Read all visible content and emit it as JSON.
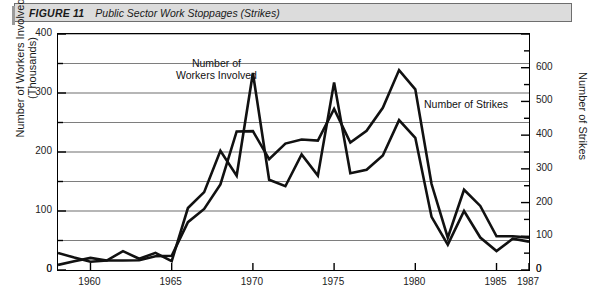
{
  "figure": {
    "number_label": "FIGURE 11",
    "title": "Public Sector Work Stoppages (Strikes)"
  },
  "axes": {
    "left_title": "Number of Workers Involved (Thousands)",
    "right_title": "Number of Strikes",
    "left_ticks": [
      "0",
      "100",
      "200",
      "300",
      "400"
    ],
    "right_ticks": [
      "0",
      "100",
      "200",
      "300",
      "400",
      "500",
      "600"
    ],
    "x_ticks": [
      "1960",
      "1965",
      "1970",
      "1975",
      "1980",
      "1985",
      "1987"
    ]
  },
  "annotations": {
    "workers_line1": "Number of",
    "workers_line2": "Workers Involved",
    "strikes": "Number of Strikes"
  },
  "colors": {
    "series_line": "#111111",
    "grid": "#6f6f6f",
    "frame": "#000000",
    "title_bar_bg": "#dcdcdc"
  },
  "chart_data": {
    "type": "line",
    "title": "Public Sector Work Stoppages (Strikes)",
    "xlabel": "",
    "ylabel": "Number of Workers Involved (Thousands)",
    "y2label": "Number of Strikes",
    "xlim": [
      1958,
      1987
    ],
    "ylim": [
      0,
      400
    ],
    "y2lim": [
      0,
      700
    ],
    "grid": true,
    "legend": "in-plot annotations",
    "x": [
      1958,
      1959,
      1960,
      1961,
      1962,
      1963,
      1964,
      1965,
      1966,
      1967,
      1968,
      1969,
      1970,
      1971,
      1972,
      1973,
      1974,
      1975,
      1976,
      1977,
      1978,
      1979,
      1980,
      1981,
      1982,
      1983,
      1984,
      1985,
      1986,
      1987
    ],
    "series": [
      {
        "name": "Number of Workers Involved",
        "axis": "left",
        "units": "thousands",
        "values": [
          29,
          21,
          14,
          16,
          32,
          19,
          29,
          15,
          105,
          132,
          202,
          160,
          334,
          153,
          142,
          196,
          160,
          318,
          164,
          170,
          194,
          254,
          224,
          90,
          43,
          100,
          55,
          32,
          53,
          48
        ]
      },
      {
        "name": "Number of Strikes",
        "axis": "right",
        "units": "count",
        "values": [
          15,
          26,
          36,
          28,
          28,
          29,
          41,
          42,
          142,
          181,
          254,
          411,
          412,
          329,
          375,
          387,
          384,
          478,
          378,
          413,
          481,
          593,
          536,
          255,
          96,
          238,
          190,
          100,
          100,
          96
        ]
      }
    ],
    "notes": {
      "workers_peak": {
        "year": 1970,
        "value": 334
      },
      "workers_secondary_peak": {
        "year": 1975,
        "value": 318
      },
      "workers_1979_peak": {
        "year": 1979,
        "value": 254
      },
      "strikes_peak": {
        "year": 1979,
        "value": 593
      }
    }
  },
  "caption": ""
}
